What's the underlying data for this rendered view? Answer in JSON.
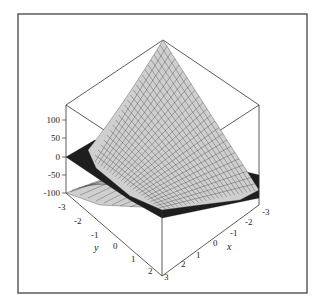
{
  "chart_data": {
    "type": "surface3d",
    "title": "",
    "axes": {
      "x": {
        "label": "x",
        "ticks": [
          "3",
          "2",
          "1",
          "0",
          "-1",
          "-2",
          "-3"
        ],
        "range": [
          -3,
          3
        ]
      },
      "y": {
        "label": "y",
        "ticks": [
          "-3",
          "-2",
          "-1",
          "0",
          "1",
          "2"
        ],
        "range": [
          -3,
          3
        ]
      },
      "z": {
        "label": "",
        "ticks": [
          "100",
          "50",
          "0",
          "-50",
          "-100"
        ],
        "range": [
          -100,
          150
        ]
      }
    },
    "series": [
      {
        "name": "surface",
        "color": "#cfcfcf",
        "style": "meshed"
      },
      {
        "name": "plane z=0",
        "color": "#1e1e1e",
        "style": "solid"
      }
    ],
    "grid": false,
    "legend": "none"
  },
  "labels": {
    "z_ticks": [
      "100",
      "50",
      "0",
      "-50",
      "-100"
    ],
    "y_ticks": [
      "-3",
      "-2",
      "-1",
      "0",
      "1",
      "2"
    ],
    "x_ticks": [
      "-3",
      "-2",
      "-1",
      "0",
      "1",
      "2",
      "3"
    ],
    "x_title": "x",
    "y_title": "y"
  }
}
